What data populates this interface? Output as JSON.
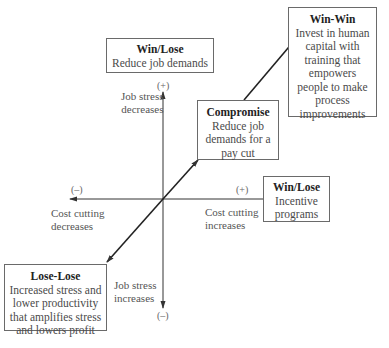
{
  "diagram": {
    "type": "quadrant-diagram",
    "boxes": {
      "win_lose_top": {
        "title": "Win/Lose",
        "body": "Reduce job demands"
      },
      "win_win": {
        "title": "Win-Win",
        "body_lines": [
          "Invest in human",
          "capital with",
          "training that",
          "empowers",
          "people to make",
          "process",
          "improvements"
        ]
      },
      "compromise": {
        "title": "Compromise",
        "body_lines": [
          "Reduce job",
          "demands for a",
          "pay cut"
        ]
      },
      "win_lose_right": {
        "title": "Win/Lose",
        "body_lines": [
          "Incentive",
          "programs"
        ]
      },
      "lose_lose": {
        "title": "Lose-Lose",
        "body_lines": [
          "Increased stress and",
          "lower productivity",
          "that amplifies stress",
          "and lowers profit"
        ]
      }
    },
    "axes": {
      "vertical": {
        "top_sign": "(+)",
        "bottom_sign": "(–)",
        "top_label_lines": [
          "Job stress",
          "decreases"
        ],
        "bottom_label_lines": [
          "Job stress",
          "increases"
        ]
      },
      "horizontal": {
        "left_sign": "(–)",
        "right_sign": "(+)",
        "left_label_lines": [
          "Cost cutting",
          "decreases"
        ],
        "right_label_lines": [
          "Cost cutting",
          "increases"
        ]
      }
    },
    "colors": {
      "line": "#333333",
      "box_border": "#6a6a6a",
      "text": "#3a3a3a"
    }
  }
}
